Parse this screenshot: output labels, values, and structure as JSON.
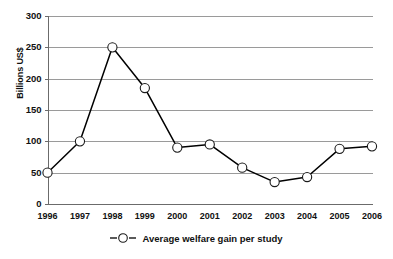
{
  "chart_data": {
    "type": "line",
    "title": "",
    "xlabel": "",
    "ylabel": "Billions US$",
    "ylim": [
      0,
      300
    ],
    "ytick_step": 50,
    "yticks": [
      "0",
      "50",
      "100",
      "150",
      "200",
      "250",
      "300"
    ],
    "grid": true,
    "legend_position": "bottom-center",
    "categories": [
      "1996",
      "1997",
      "1998",
      "1999",
      "2000",
      "2001",
      "2002",
      "2003",
      "2004",
      "2005",
      "2006"
    ],
    "series": [
      {
        "name": "Average welfare gain per study",
        "values": [
          50,
          100,
          250,
          185,
          90,
          95,
          58,
          35,
          43,
          88,
          92
        ]
      }
    ],
    "colors": {
      "line": "#000000",
      "marker_fill": "#ffffff",
      "marker_stroke": "#1a1a1a",
      "gridline": "#9a9a9a",
      "axis": "#6b6b6b",
      "text": "#111111",
      "background": "#ffffff"
    }
  },
  "legend": {
    "marker_name": "open-circle-marker",
    "label": "Average welfare gain per study"
  }
}
